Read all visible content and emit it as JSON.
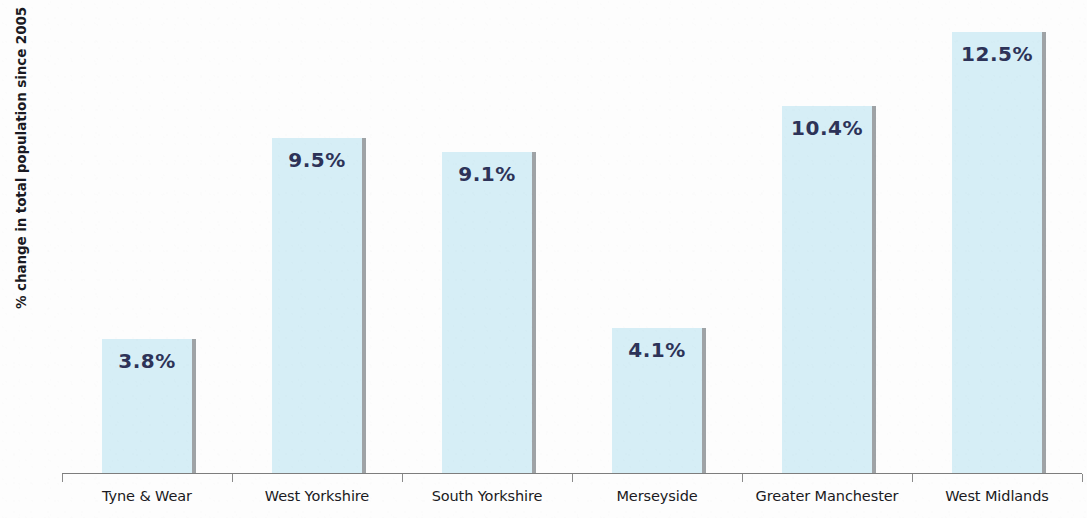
{
  "chart_data": {
    "type": "bar",
    "title": "",
    "subtitle": "",
    "xlabel": "",
    "ylabel": "% change in total population since 2005",
    "categories": [
      "Tyne & Wear",
      "West Yorkshire",
      "South Yorkshire",
      "Merseyside",
      "Greater Manchester",
      "West Midlands"
    ],
    "values": [
      3.8,
      9.5,
      9.1,
      4.1,
      10.4,
      12.5
    ],
    "data_labels": [
      "3.8%",
      "9.5%",
      "9.1%",
      "4.1%",
      "10.4%",
      "12.5%"
    ],
    "ylim": [
      0,
      13.4
    ],
    "grid": false,
    "legend": null,
    "legend_position": "none",
    "bar_color": "#d6eef6",
    "bar_shadow_color": "#9fa3a6",
    "label_color": "#2d3358",
    "axis_color": "#7d7d7d",
    "axis_label_color": "#1a1a22",
    "background_color": "#fdfdfd",
    "y_axis_ticks_visible": false,
    "x_axis_ticks_visible": true
  }
}
